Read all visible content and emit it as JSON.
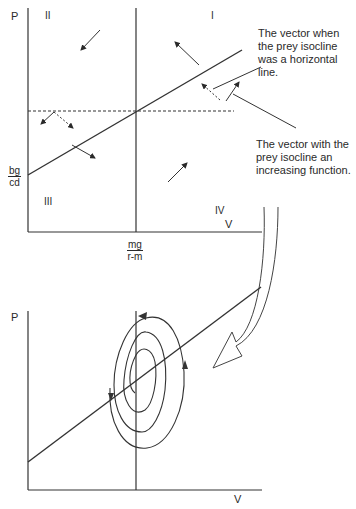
{
  "top_plot": {
    "y_axis_label": "P",
    "x_axis_label": "V",
    "quadrants": {
      "q1": "I",
      "q2": "II",
      "q3": "III",
      "q4": "IV"
    },
    "y_intercept_label": {
      "numerator": "bg",
      "denominator": "cd"
    },
    "x_isocline_label": {
      "numerator": "mg",
      "denominator": "r-m"
    }
  },
  "annotations": {
    "horizontal_vector": "The vector when the prey isocline was a horizontal line.",
    "increasing_vector": "The vector with the prey isocline an increasing function."
  },
  "bottom_plot": {
    "y_axis_label": "P",
    "x_axis_label": "V"
  },
  "colors": {
    "ink": "#2a2a2a",
    "background": "#ffffff"
  }
}
